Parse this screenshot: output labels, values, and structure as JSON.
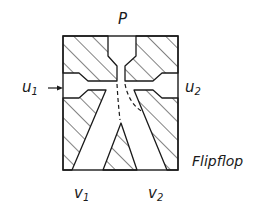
{
  "diagram": {
    "title": "Flipflop",
    "type": "fluidic bistable element cross-section",
    "labels": {
      "supply": "P",
      "control_left": {
        "base": "u",
        "sub": "1"
      },
      "control_right": {
        "base": "u",
        "sub": "2"
      },
      "output_left": {
        "base": "v",
        "sub": "1"
      },
      "output_right": {
        "base": "v",
        "sub": "2"
      },
      "name": "Flipflop"
    },
    "arrows": [
      {
        "from": "u1",
        "to": "control-channel-left",
        "direction": "right"
      }
    ],
    "colors": {
      "stroke": "#1a1a1a",
      "background": "#ffffff"
    }
  }
}
